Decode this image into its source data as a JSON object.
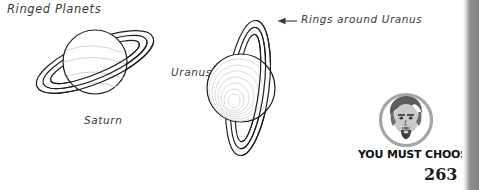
{
  "page": {
    "width": 479,
    "height": 190,
    "background_color": "#ffffff",
    "page_number": "263"
  },
  "title": "Ringed Planets",
  "figures": {
    "saturn": {
      "label": "Saturn",
      "planet_name": "Saturn",
      "ring_count": 3,
      "ring_orientation": "tilted",
      "outline_color": "#1d1d1d"
    },
    "uranus": {
      "label": "Uranus",
      "planet_name": "Uranus",
      "ring_count": 3,
      "ring_orientation": "vertical",
      "outline_color": "#1d1d1d"
    }
  },
  "callout": {
    "text": "Rings around Uranus",
    "arrow_direction": "left"
  },
  "badge": {
    "caption": "YOU MUST CHOOSE!",
    "icon": "bearded-face-icon",
    "circle_color": "#9a9a9a",
    "caption_color": "#121212"
  },
  "right_band": {
    "present": true,
    "color": "#8e8e8e"
  }
}
